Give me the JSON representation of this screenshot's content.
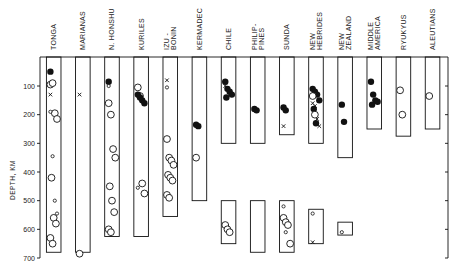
{
  "chart_data": {
    "type": "scatter",
    "title": "",
    "xlabel": "",
    "ylabel": "DEPTH, KM",
    "ylim": [
      0,
      700
    ],
    "y_inverted": true,
    "yticks": [
      100,
      200,
      300,
      400,
      500,
      600,
      700
    ],
    "grid": false,
    "legend": null,
    "categories": [
      "TONGA",
      "MARIANAS",
      "N. HONSHU",
      "KURILES",
      "IZU-BONIN",
      "KERMADEC",
      "CHILE",
      "PHILIP-PINES",
      "SUNDA",
      "NEW HEBRIDES",
      "NEW ZEALAND",
      "MIDDLE AMERICA",
      "RYUKYUS",
      "ALEUTIANS"
    ],
    "category_labels": [
      [
        "TONGA"
      ],
      [
        "MARIANAS"
      ],
      [
        "N. HONSHU"
      ],
      [
        "KURILES"
      ],
      [
        "IZU -",
        "BONIN"
      ],
      [
        "KERMADEC"
      ],
      [
        "CHILE"
      ],
      [
        "PHILIP-",
        "PINES"
      ],
      [
        "SUNDA"
      ],
      [
        "NEW",
        "HEBRIDES"
      ],
      [
        "NEW",
        "ZEALAND"
      ],
      [
        "MIDDLE",
        "AMERICA"
      ],
      [
        "RYUKYUS"
      ],
      [
        "ALEUTIANS"
      ]
    ],
    "marker_types": {
      "open_circle": "open circle",
      "filled_circle": "filled circle",
      "x": "cross"
    },
    "depth_ranges": [
      {
        "region": "TONGA",
        "ranges": [
          [
            0,
            680
          ]
        ]
      },
      {
        "region": "MARIANAS",
        "ranges": [
          [
            0,
            680
          ]
        ]
      },
      {
        "region": "N. HONSHU",
        "ranges": [
          [
            0,
            625
          ]
        ]
      },
      {
        "region": "KURILES",
        "ranges": [
          [
            0,
            625
          ]
        ]
      },
      {
        "region": "IZU-BONIN",
        "ranges": [
          [
            0,
            555
          ]
        ]
      },
      {
        "region": "KERMADEC",
        "ranges": [
          [
            0,
            500
          ]
        ]
      },
      {
        "region": "CHILE",
        "ranges": [
          [
            0,
            300
          ],
          [
            500,
            650
          ]
        ]
      },
      {
        "region": "PHILIP-PINES",
        "ranges": [
          [
            0,
            300
          ],
          [
            500,
            680
          ]
        ]
      },
      {
        "region": "SUNDA",
        "ranges": [
          [
            0,
            270
          ],
          [
            500,
            680
          ]
        ]
      },
      {
        "region": "NEW HEBRIDES",
        "ranges": [
          [
            0,
            300
          ],
          [
            530,
            650
          ]
        ]
      },
      {
        "region": "NEW ZEALAND",
        "ranges": [
          [
            0,
            350
          ],
          [
            575,
            620
          ]
        ]
      },
      {
        "region": "MIDDLE AMERICA",
        "ranges": [
          [
            0,
            250
          ]
        ]
      },
      {
        "region": "RYUKYUS",
        "ranges": [
          [
            0,
            275
          ]
        ]
      },
      {
        "region": "ALEUTIANS",
        "ranges": [
          [
            0,
            250
          ]
        ]
      }
    ],
    "points": [
      {
        "region": "TONGA",
        "marker": "filled_circle",
        "depths": [
          50
        ]
      },
      {
        "region": "TONGA",
        "marker": "open_circle",
        "depths": [
          95,
          90,
          195,
          215,
          420,
          560,
          580,
          630,
          650
        ]
      },
      {
        "region": "TONGA",
        "marker": "small_open_circle",
        "depths": [
          190,
          345,
          500,
          545
        ]
      },
      {
        "region": "TONGA",
        "marker": "x",
        "depths": [
          130
        ]
      },
      {
        "region": "MARIANAS",
        "marker": "x",
        "depths": [
          130
        ]
      },
      {
        "region": "MARIANAS",
        "marker": "open_circle",
        "depths": [
          685
        ]
      },
      {
        "region": "N. HONSHU",
        "marker": "filled_circle",
        "depths": [
          85
        ]
      },
      {
        "region": "N. HONSHU",
        "marker": "small_open_circle",
        "depths": [
          100
        ]
      },
      {
        "region": "N. HONSHU",
        "marker": "open_circle",
        "depths": [
          160,
          200,
          320,
          350,
          450,
          500,
          540,
          600,
          610
        ]
      },
      {
        "region": "KURILES",
        "marker": "open_circle",
        "depths": [
          105,
          135,
          440,
          475
        ]
      },
      {
        "region": "KURILES",
        "marker": "filled_circle",
        "depths": [
          130,
          140,
          150,
          160
        ]
      },
      {
        "region": "KURILES",
        "marker": "small_open_circle",
        "depths": [
          455
        ]
      },
      {
        "region": "IZU-BONIN",
        "marker": "x",
        "depths": [
          80
        ]
      },
      {
        "region": "IZU-BONIN",
        "marker": "small_open_circle",
        "depths": [
          105
        ]
      },
      {
        "region": "IZU-BONIN",
        "marker": "open_circle",
        "depths": [
          285,
          350,
          360,
          375,
          410,
          420,
          430,
          480,
          490
        ]
      },
      {
        "region": "KERMADEC",
        "marker": "filled_circle",
        "depths": [
          235,
          240
        ]
      },
      {
        "region": "KERMADEC",
        "marker": "open_circle",
        "depths": [
          350
        ]
      },
      {
        "region": "CHILE",
        "marker": "filled_circle",
        "depths": [
          85,
          110,
          120,
          130,
          140
        ]
      },
      {
        "region": "CHILE",
        "marker": "x",
        "depths": [
          100
        ]
      },
      {
        "region": "CHILE",
        "marker": "open_circle",
        "depths": [
          585,
          600,
          610
        ]
      },
      {
        "region": "PHILIP-PINES",
        "marker": "filled_circle",
        "depths": [
          180,
          185
        ]
      },
      {
        "region": "SUNDA",
        "marker": "filled_circle",
        "depths": [
          175,
          185
        ]
      },
      {
        "region": "SUNDA",
        "marker": "x",
        "depths": [
          240
        ]
      },
      {
        "region": "SUNDA",
        "marker": "open_circle",
        "depths": [
          560,
          575,
          585,
          650
        ]
      },
      {
        "region": "SUNDA",
        "marker": "small_open_circle",
        "depths": [
          520,
          610
        ]
      },
      {
        "region": "NEW HEBRIDES",
        "marker": "filled_circle",
        "depths": [
          110,
          120,
          130,
          150,
          180,
          230
        ]
      },
      {
        "region": "NEW HEBRIDES",
        "marker": "x",
        "depths": [
          160,
          170,
          215,
          240
        ]
      },
      {
        "region": "NEW HEBRIDES",
        "marker": "open_circle",
        "depths": [
          135,
          200
        ]
      },
      {
        "region": "NEW HEBRIDES",
        "marker": "small_open_circle",
        "depths": [
          545
        ]
      },
      {
        "region": "NEW HEBRIDES",
        "marker": "x",
        "depths": [
          645
        ]
      },
      {
        "region": "NEW ZEALAND",
        "marker": "filled_circle",
        "depths": [
          165,
          225
        ]
      },
      {
        "region": "NEW ZEALAND",
        "marker": "small_open_circle",
        "depths": [
          610
        ]
      },
      {
        "region": "MIDDLE AMERICA",
        "marker": "filled_circle",
        "depths": [
          85,
          130,
          150,
          155,
          165
        ]
      },
      {
        "region": "RYUKYUS",
        "marker": "open_circle",
        "depths": [
          115,
          200
        ]
      },
      {
        "region": "ALEUTIANS",
        "marker": "open_circle",
        "depths": [
          135
        ]
      }
    ]
  },
  "axis": {
    "ylabel": "DEPTH, KM",
    "ticks": [
      "100",
      "200",
      "300",
      "400",
      "500",
      "600",
      "700"
    ]
  },
  "labels": [
    {
      "l1": "TONGA",
      "l2": ""
    },
    {
      "l1": "MARIANAS",
      "l2": ""
    },
    {
      "l1": "N. HONSHU",
      "l2": ""
    },
    {
      "l1": "KURILES",
      "l2": ""
    },
    {
      "l1": "IZU -",
      "l2": "BONIN"
    },
    {
      "l1": "KERMADEC",
      "l2": ""
    },
    {
      "l1": "CHILE",
      "l2": ""
    },
    {
      "l1": "PHILIP-",
      "l2": "PINES"
    },
    {
      "l1": "SUNDA",
      "l2": ""
    },
    {
      "l1": "NEW",
      "l2": "HEBRIDES"
    },
    {
      "l1": "NEW",
      "l2": "ZEALAND"
    },
    {
      "l1": "MIDDLE",
      "l2": "AMERICA"
    },
    {
      "l1": "RYUKYUS",
      "l2": ""
    },
    {
      "l1": "ALEUTIANS",
      "l2": ""
    }
  ],
  "colors": {
    "ink": "#111111",
    "background": "#ffffff"
  }
}
